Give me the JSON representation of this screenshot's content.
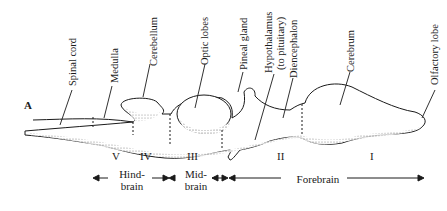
{
  "figure": {
    "panel_letter": "A",
    "labels": {
      "spinal_cord": "Spinal cord",
      "medulla": "Medulla",
      "cerebellum": "Cerebellum",
      "optic_lobes": "Optic lobes",
      "pineal_gland": "Pineal gland",
      "hypothalamus_1": "Hypothalamus",
      "hypothalamus_2": "(to pituitary)",
      "diencephalon": "Diencephalon",
      "cerebrum": "Cerebrum",
      "olfactory_lobe": "Olfactory lobe"
    },
    "segments": [
      "V",
      "IV",
      "III",
      "II",
      "I"
    ],
    "regions": {
      "hindbrain_1": "Hind-",
      "hindbrain_2": "brain",
      "midbrain_1": "Mid-",
      "midbrain_2": "brain",
      "forebrain": "Forebrain"
    },
    "colors": {
      "ink": "#1a1a1a",
      "shade": "#8a8a8a",
      "background": "#ffffff"
    }
  }
}
